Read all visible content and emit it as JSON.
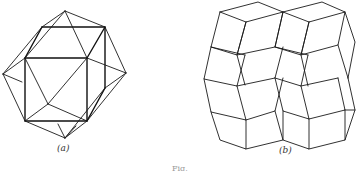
{
  "figure": {
    "panel_a": {
      "label": "(a)",
      "description": "Cube with pyramidal caps (polyhedron wireframe)"
    },
    "panel_b": {
      "label": "(b)",
      "description": "Tiling of rhombic/parallelogram faces forming stacked rhombohedra"
    },
    "caption_fragment": "Fig."
  },
  "colors": {
    "line": "#1a1a1a",
    "background": "#ffffff",
    "label": "#333333"
  }
}
